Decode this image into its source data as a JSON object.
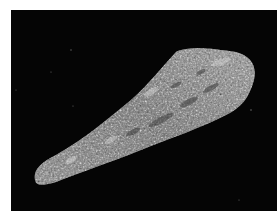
{
  "image": {
    "description": "Grayscale micrograph of an elongated leaf-shaped specimen on a black background",
    "subject": "leaf-shaped specimen",
    "background_color": "#050505",
    "margin_color": "#ffffff",
    "specimen_tones": {
      "light": "#c8c8c8",
      "mid": "#8a8a8a",
      "dark": "#4a4a4a"
    }
  }
}
